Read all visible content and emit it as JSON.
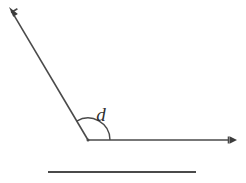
{
  "figure": {
    "type": "geometry-diagram",
    "width": 246,
    "height": 183,
    "background_color": "#ffffff",
    "stroke_color": "#4a4a4a",
    "label_color": "#2e2e2e",
    "vertex": {
      "label": "vertex",
      "x": 88,
      "y": 140
    },
    "angle": {
      "label": "d",
      "label_x": 101,
      "label_y": 121,
      "arc_radius": 22,
      "arc_start_deg": 0,
      "arc_end_deg": 121,
      "opening_side": "above"
    },
    "rays": [
      {
        "name": "horizontal-ray",
        "from_x": 88,
        "from_y": 140,
        "to_x": 237,
        "to_y": 140,
        "direction_deg": 0,
        "arrow": "end"
      },
      {
        "name": "diagonal-ray",
        "from_x": 88,
        "from_y": 140,
        "to_x": 9,
        "to_y": 7,
        "direction_deg": 121,
        "arrow": "end"
      }
    ],
    "baseline": {
      "name": "reference-line-segment",
      "from_x": 48,
      "from_y": 172,
      "to_x": 196,
      "to_y": 172,
      "arrow": "none"
    }
  }
}
